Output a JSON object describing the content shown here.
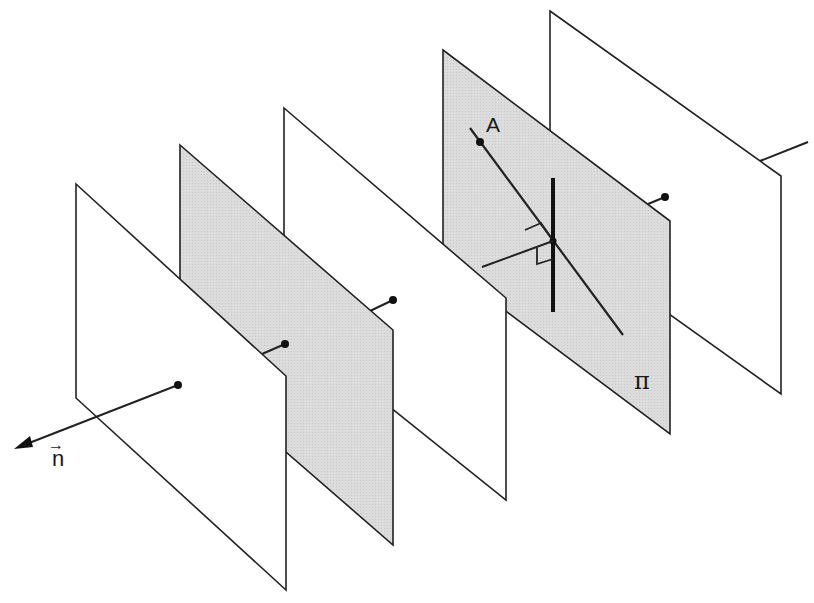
{
  "diagram": {
    "colors": {
      "stroke": "#222222",
      "shaded_plane": "#d9d9d9",
      "plain_plane": "#ffffff"
    },
    "labels": {
      "point_a": "A",
      "plane_pi": "π",
      "normal_vector": "n",
      "normal_vector_arrow": "→"
    },
    "planes": [
      {
        "id": "plane-1",
        "shaded": false,
        "corners": [
          [
            76,
            184
          ],
          [
            286,
            376
          ],
          [
            286,
            590
          ],
          [
            76,
            398
          ]
        ]
      },
      {
        "id": "plane-2",
        "shaded": true,
        "corners": [
          [
            180,
            145
          ],
          [
            393,
            330
          ],
          [
            393,
            545
          ],
          [
            180,
            360
          ]
        ]
      },
      {
        "id": "plane-3",
        "shaded": false,
        "corners": [
          [
            284,
            108
          ],
          [
            506,
            298
          ],
          [
            506,
            500
          ],
          [
            284,
            322
          ]
        ]
      },
      {
        "id": "plane-pi",
        "shaded": true,
        "corners": [
          [
            443,
            50
          ],
          [
            670,
            221
          ],
          [
            670,
            434
          ],
          [
            443,
            264
          ]
        ]
      },
      {
        "id": "plane-5",
        "shaded": false,
        "corners": [
          [
            550,
            11
          ],
          [
            781,
            176
          ],
          [
            781,
            394
          ],
          [
            550,
            225
          ]
        ]
      }
    ],
    "normal_points": [
      {
        "plane": "plane-1",
        "point": [
          178,
          385
        ]
      },
      {
        "plane": "plane-2",
        "point": [
          285,
          344
        ]
      },
      {
        "plane": "plane-3",
        "point": [
          393,
          300
        ]
      },
      {
        "plane": "plane-pi",
        "point": [
          665,
          197
        ]
      }
    ]
  }
}
